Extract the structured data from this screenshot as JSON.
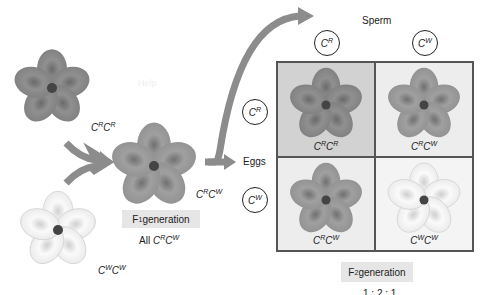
{
  "diagram": {
    "watermark": "Help",
    "colors": {
      "red_flower": "#8a8a8a",
      "pink_flower": "#9a9a9a",
      "white_flower": "#f2f2f2",
      "arrow": "#8c8c8c",
      "gen_box": "#e6e6e6"
    },
    "parents": [
      {
        "genotype": {
          "base1": "C",
          "allele1": "R",
          "base2": "C",
          "allele2": "R"
        },
        "color": "red"
      },
      {
        "genotype": {
          "base1": "C",
          "allele1": "W",
          "base2": "C",
          "allele2": "W"
        },
        "color": "white"
      }
    ],
    "f1": {
      "genotype": {
        "base1": "C",
        "allele1": "R",
        "base2": "C",
        "allele2": "W"
      },
      "label_main": "F",
      "label_sub": "1",
      "label_rest": " generation",
      "all_prefix": "All ",
      "all_genotype": {
        "base1": "C",
        "allele1": "R",
        "base2": "C",
        "allele2": "W"
      }
    },
    "sperm_label": "Sperm",
    "eggs_label": "Eggs",
    "sperm_alleles": [
      {
        "base": "C",
        "allele": "R"
      },
      {
        "base": "C",
        "allele": "W"
      }
    ],
    "egg_alleles": [
      {
        "base": "C",
        "allele": "R"
      },
      {
        "base": "C",
        "allele": "W"
      }
    ],
    "punnett": [
      {
        "genotype": {
          "base1": "C",
          "allele1": "R",
          "base2": "C",
          "allele2": "R"
        },
        "color": "red"
      },
      {
        "genotype": {
          "base1": "C",
          "allele1": "R",
          "base2": "C",
          "allele2": "W"
        },
        "color": "pink"
      },
      {
        "genotype": {
          "base1": "C",
          "allele1": "R",
          "base2": "C",
          "allele2": "W"
        },
        "color": "pink"
      },
      {
        "genotype": {
          "base1": "C",
          "allele1": "W",
          "base2": "C",
          "allele2": "W"
        },
        "color": "white"
      }
    ],
    "f2": {
      "label_main": "F",
      "label_sub": "2",
      "label_rest": " generation",
      "ratio_partial": "1 : 2 : 1"
    }
  }
}
